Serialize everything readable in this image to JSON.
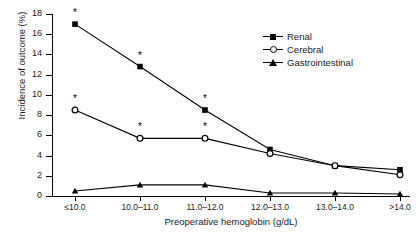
{
  "chart_data": {
    "type": "line",
    "title": "",
    "xlabel": "Preoperative hemoglobin (g/dL)",
    "ylabel": "Incidence of outcome (%)",
    "categories": [
      "≤10.0",
      "10.0–11.0",
      "11.0–12.0",
      "12.0–13.0",
      "13.0–14.0",
      ">14.0"
    ],
    "ylim": [
      0,
      18
    ],
    "yticks": [
      0,
      2,
      4,
      6,
      8,
      10,
      12,
      14,
      16,
      18
    ],
    "grid": false,
    "legend_position": "top-right",
    "series": [
      {
        "name": "Renal",
        "marker": "filled-square",
        "color": "#000000",
        "values": [
          17.0,
          12.8,
          8.5,
          4.6,
          3.0,
          2.6
        ],
        "significance": [
          true,
          true,
          true,
          false,
          false,
          false
        ]
      },
      {
        "name": "Cerebral",
        "marker": "open-circle",
        "color": "#000000",
        "values": [
          8.5,
          5.7,
          5.7,
          4.2,
          3.0,
          2.1
        ],
        "significance": [
          true,
          true,
          true,
          false,
          false,
          false
        ]
      },
      {
        "name": "Gastrointestinal",
        "marker": "filled-triangle",
        "color": "#000000",
        "values": [
          0.5,
          1.1,
          1.1,
          0.3,
          0.3,
          0.2
        ],
        "significance": [
          false,
          false,
          false,
          false,
          false,
          false
        ]
      }
    ],
    "annotations": {
      "significance_symbol": "*",
      "note": "Asterisk marks statistically significant points"
    }
  },
  "legend": {
    "items": [
      {
        "label": "Renal",
        "marker": "filled-square"
      },
      {
        "label": "Cerebral",
        "marker": "open-circle"
      },
      {
        "label": "Gastrointestinal",
        "marker": "filled-triangle"
      }
    ]
  }
}
